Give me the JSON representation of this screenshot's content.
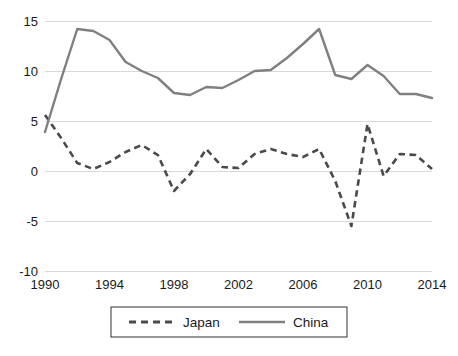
{
  "chart_data": {
    "type": "line",
    "title": "",
    "subtitle": "",
    "xlabel": "",
    "ylabel": "",
    "xlim": [
      1990,
      2014
    ],
    "ylim": [
      -10,
      15
    ],
    "yticks": [
      15,
      10,
      5,
      0,
      -5,
      -10
    ],
    "ytick_labels": [
      "15",
      "10",
      "5",
      "0",
      "-5",
      "-10"
    ],
    "xticks": [
      1990,
      1994,
      1998,
      2002,
      2006,
      2010,
      2014
    ],
    "xtick_labels": [
      "1990",
      "1994",
      "1998",
      "2002",
      "2006",
      "2010",
      "2014"
    ],
    "grid": "horizontal",
    "legend_position": "bottom",
    "x": [
      1990,
      1991,
      1992,
      1993,
      1994,
      1995,
      1996,
      1997,
      1998,
      1999,
      2000,
      2001,
      2002,
      2003,
      2004,
      2005,
      2006,
      2007,
      2008,
      2009,
      2010,
      2011,
      2012,
      2013,
      2014
    ],
    "series": [
      {
        "name": "Japan",
        "style": "dashed",
        "color": "#4a4a4a",
        "values": [
          5.6,
          3.3,
          0.8,
          0.2,
          0.9,
          1.9,
          2.6,
          1.6,
          -2.0,
          -0.3,
          2.2,
          0.4,
          0.3,
          1.7,
          2.2,
          1.7,
          1.4,
          2.2,
          -1.0,
          -5.5,
          4.7,
          -0.5,
          1.7,
          1.6,
          0.2
        ]
      },
      {
        "name": "China",
        "style": "solid",
        "color": "#808080",
        "values": [
          3.9,
          9.2,
          14.2,
          14.0,
          13.1,
          10.9,
          10.0,
          9.3,
          7.8,
          7.6,
          8.4,
          8.3,
          9.1,
          10.0,
          10.1,
          11.3,
          12.7,
          14.2,
          9.6,
          9.2,
          10.6,
          9.5,
          7.7,
          7.7,
          7.3
        ]
      }
    ]
  },
  "legend": {
    "items": [
      {
        "label": "Japan",
        "style": "dashed",
        "color": "#4a4a4a"
      },
      {
        "label": "China",
        "style": "solid",
        "color": "#808080"
      }
    ]
  },
  "colors": {
    "japan": "#4a4a4a",
    "china": "#808080",
    "gridline": "#d9d9d9",
    "text": "#1a1a1a",
    "legend_border": "#333333",
    "background": "#ffffff"
  }
}
